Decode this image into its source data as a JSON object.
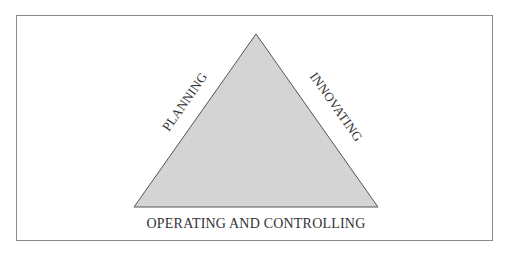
{
  "diagram": {
    "type": "triangle",
    "fill_color": "#d4d4d4",
    "stroke_color": "#555555",
    "labels": {
      "left_side": "PLANNING",
      "right_side": "INNOVATING",
      "base": "OPERATING AND CONTROLLING"
    }
  }
}
